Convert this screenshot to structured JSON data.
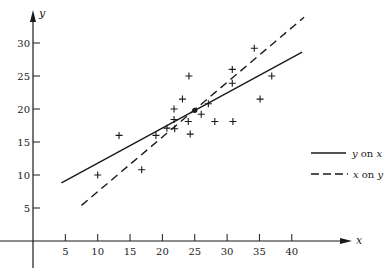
{
  "chart_data": {
    "type": "scatter",
    "title": "",
    "xlabel": "x",
    "ylabel": "y",
    "xlim": [
      0,
      45
    ],
    "ylim": [
      0,
      35
    ],
    "grid": false,
    "legend_position": "right",
    "x_ticks": [
      5,
      10,
      15,
      20,
      25,
      30,
      35,
      40
    ],
    "y_ticks": [
      5,
      10,
      15,
      20,
      25,
      30
    ],
    "points": [
      [
        10,
        10
      ],
      [
        13.3,
        16
      ],
      [
        16.8,
        10.8
      ],
      [
        19,
        16
      ],
      [
        20.7,
        17.1
      ],
      [
        21.8,
        18.4
      ],
      [
        21.9,
        17
      ],
      [
        21.8,
        20
      ],
      [
        23.1,
        21.5
      ],
      [
        24.1,
        25
      ],
      [
        24,
        18.1
      ],
      [
        24.3,
        16.2
      ],
      [
        26,
        19.2
      ],
      [
        27.1,
        20.8
      ],
      [
        28.1,
        18.1
      ],
      [
        30.8,
        26
      ],
      [
        30.8,
        23.9
      ],
      [
        30.9,
        18.1
      ],
      [
        34.2,
        29.2
      ],
      [
        35.1,
        21.5
      ],
      [
        36.9,
        25
      ]
    ],
    "mean_point": [
      25,
      19.8
    ],
    "series": [
      {
        "name": "y on x",
        "style": "solid",
        "x": [
          4.4,
          41.6
        ],
        "y": [
          8.8,
          28.6
        ]
      },
      {
        "name": "x on y",
        "style": "dashed",
        "x": [
          7.5,
          41.9
        ],
        "y": [
          5.4,
          33.9
        ]
      }
    ]
  },
  "legend": {
    "items": [
      {
        "var1": "y",
        "mid": " on ",
        "var2": "x",
        "style": "solid"
      },
      {
        "var1": "x",
        "mid": " on ",
        "var2": "y",
        "style": "dashed"
      }
    ]
  },
  "colors": {
    "ink": "#1a1a1a"
  }
}
